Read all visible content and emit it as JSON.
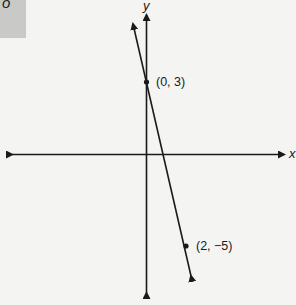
{
  "corner": {
    "text": "o"
  },
  "axes": {
    "x_label": "x",
    "y_label": "y"
  },
  "points": [
    {
      "label": "(0, 3)",
      "x": 0,
      "y": 3
    },
    {
      "label": "(2, −5)",
      "x": 2,
      "y": -5
    }
  ],
  "line": {
    "slope": -4,
    "intercept": 3,
    "equation": "y = -4x + 3"
  },
  "colors": {
    "ink": "#1a1a1a",
    "background": "#f4f4f2",
    "corner_box": "#c9c9c7"
  }
}
